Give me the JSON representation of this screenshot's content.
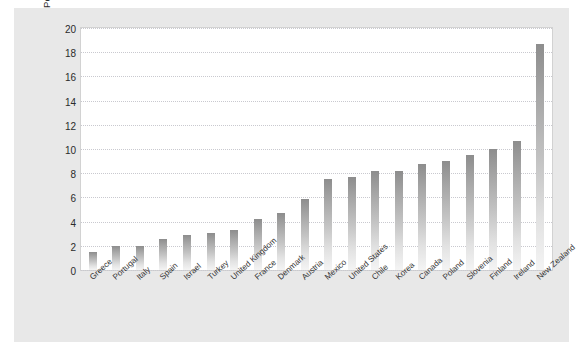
{
  "chart_data": {
    "type": "bar",
    "title": "",
    "xlabel": "",
    "ylabel": "Per 100 000 Youth Aged 15 to 19 Years",
    "ylim": [
      0,
      20
    ],
    "ytick_step": 2,
    "yticks": [
      0,
      2,
      4,
      6,
      8,
      10,
      12,
      14,
      16,
      18,
      20
    ],
    "grid": "horizontal-dotted",
    "legend": "none",
    "categories": [
      "Greece",
      "Portugal",
      "Italy",
      "Spain",
      "Israel",
      "Turkey",
      "United Kingdom",
      "France",
      "Denmark",
      "Austria",
      "Mexico",
      "United States",
      "Chile",
      "Korea",
      "Canada",
      "Poland",
      "Slovenia",
      "Finland",
      "Ireland",
      "New Zealand"
    ],
    "values": [
      1.5,
      2.0,
      2.0,
      2.6,
      2.9,
      3.1,
      3.3,
      4.2,
      4.7,
      5.9,
      7.5,
      7.7,
      8.2,
      8.2,
      8.8,
      9.0,
      9.5,
      10.0,
      10.7,
      18.7
    ],
    "bar_color_top": "#8d8d8d",
    "bar_color_bottom": "#f4f4f4"
  },
  "colors": {
    "figure_background": "#e8e8e8",
    "plot_background": "#ffffff",
    "grid": "#c9c9cf",
    "text": "#2b2b2b",
    "page_background": "#ffffff"
  }
}
